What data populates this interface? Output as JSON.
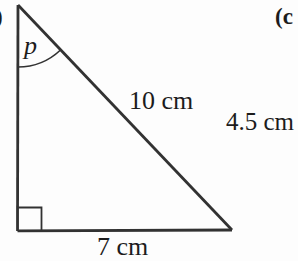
{
  "colors": {
    "bg": "#fdfdfd",
    "line": "#323232",
    "text": "#1c1c1c"
  },
  "figure": {
    "angle_label": "p",
    "hypotenuse_label": "10 cm",
    "base_label": "7 cm",
    "right_side_label": "4.5 cm",
    "next_part_label": "(c",
    "prev_part_label_fragment": ")"
  }
}
